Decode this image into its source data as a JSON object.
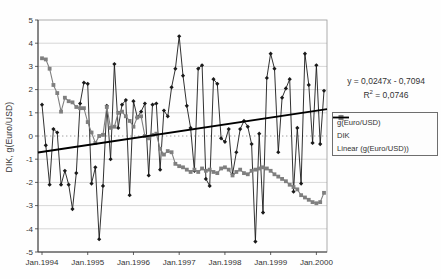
{
  "chart_data": {
    "type": "line",
    "title": "",
    "xlabel": "",
    "ylabel": "DIK, g(Euro/USD)",
    "ylim": [
      -5,
      5
    ],
    "ytick_step": 1,
    "grid": "horizontal, zero line dotted",
    "legend_position": "right",
    "x_labels": [
      "Jan.1994",
      "Jan.1995",
      "Jan.1996",
      "Jan.1997",
      "Jan.1998",
      "Jan.1999",
      "Jan.2000"
    ],
    "months_per_x_label": 12,
    "series": [
      {
        "name": "g(Euro/USD)",
        "marker": "diamond",
        "color": "#1a1a1a",
        "values": [
          1.35,
          -0.4,
          -2.1,
          0.3,
          0.15,
          -2.1,
          -1.5,
          -2.1,
          -3.15,
          -1.6,
          1.4,
          2.3,
          2.25,
          -2.05,
          -1.35,
          -4.45,
          -2.15,
          1.3,
          -1.0,
          3.1,
          0.35,
          1.35,
          1.55,
          -2.55,
          1.5,
          0.8,
          1.05,
          1.4,
          -1.7,
          1.35,
          1.4,
          -1.45,
          1.1,
          0.85,
          2.1,
          2.9,
          4.3,
          2.6,
          1.3,
          0.35,
          -1.5,
          2.9,
          3.05,
          -1.85,
          -2.15,
          2.45,
          2.25,
          -0.1,
          -0.25,
          0.3,
          -1.65,
          -0.7,
          0.3,
          0.65,
          0.4,
          -0.35,
          -4.55,
          0.1,
          -3.3,
          2.5,
          3.55,
          2.9,
          -0.7,
          1.65,
          2.05,
          2.45,
          -2.4,
          0.35,
          -2.05,
          3.55,
          2.2,
          -0.3,
          3.05,
          -0.35,
          1.95
        ]
      },
      {
        "name": "DIK",
        "marker": "square",
        "color": "#7f7f7f",
        "values": [
          3.35,
          3.3,
          2.9,
          2.2,
          1.85,
          1.05,
          1.65,
          1.5,
          1.45,
          1.25,
          1.2,
          1.2,
          0.6,
          0.15,
          -0.3,
          0.0,
          0.05,
          1.25,
          0.35,
          0.4,
          1.0,
          1.05,
          0.85,
          0.65,
          0.4,
          0.8,
          0.85,
          0.0,
          -0.1,
          0.05,
          0.1,
          -0.55,
          -0.8,
          -0.65,
          -0.7,
          -1.2,
          -1.3,
          -1.35,
          -1.45,
          -1.55,
          -1.45,
          -1.55,
          -1.4,
          -1.5,
          -1.45,
          -1.55,
          -1.6,
          -1.4,
          -1.35,
          -1.45,
          -1.7,
          -1.55,
          -1.45,
          -1.6,
          -1.65,
          -1.5,
          -1.45,
          -1.4,
          -1.35,
          -1.4,
          -1.5,
          -1.65,
          -1.75,
          -1.85,
          -1.95,
          -2.1,
          -2.2,
          -2.3,
          -2.55,
          -2.65,
          -2.75,
          -2.85,
          -2.9,
          -2.85,
          -2.45
        ]
      }
    ],
    "trendline": {
      "name": "Linear (g(Euro/USD))",
      "slope": 0.0247,
      "intercept": -0.7094,
      "color": "#000000"
    },
    "annotations": {
      "equation": "y = 0,0247x - 0,7094",
      "r2_base": "R",
      "r2_sup": "2",
      "r2_tail": " = 0,0746"
    }
  }
}
